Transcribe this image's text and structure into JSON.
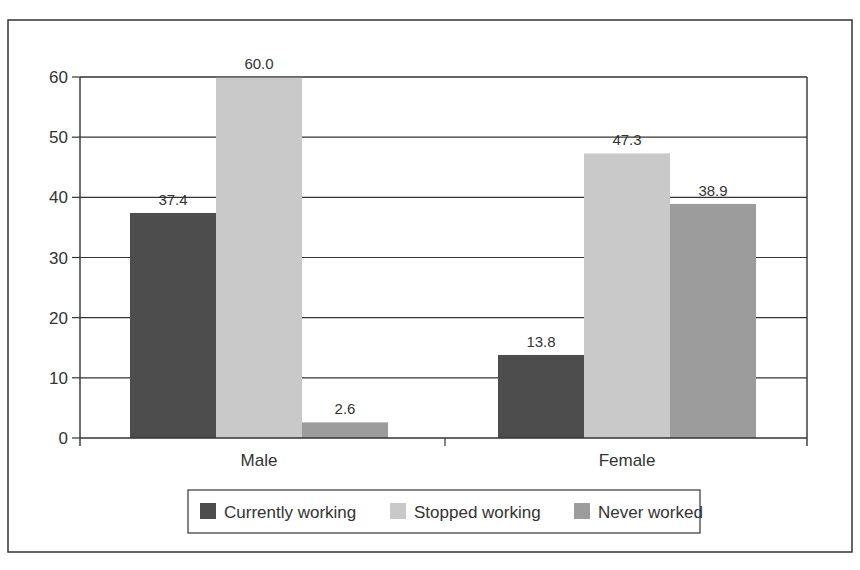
{
  "chart_data": {
    "type": "bar",
    "title": "",
    "xlabel": "",
    "ylabel": "",
    "ylim": [
      0,
      60
    ],
    "yticks": [
      0,
      10,
      20,
      30,
      40,
      50,
      60
    ],
    "grid": true,
    "legend_position": "bottom",
    "categories": [
      "Male",
      "Female"
    ],
    "series": [
      {
        "name": "Currently working",
        "color": "#4d4d4d",
        "values": [
          37.4,
          13.8
        ],
        "labels": [
          "37.4",
          "13.8"
        ]
      },
      {
        "name": "Stopped working",
        "color": "#c9c9c9",
        "values": [
          60.0,
          47.3
        ],
        "labels": [
          "60.0",
          "47.3"
        ]
      },
      {
        "name": "Never worked",
        "color": "#9c9c9c",
        "values": [
          2.6,
          38.9
        ],
        "labels": [
          "2.6",
          "38.9"
        ]
      }
    ]
  }
}
